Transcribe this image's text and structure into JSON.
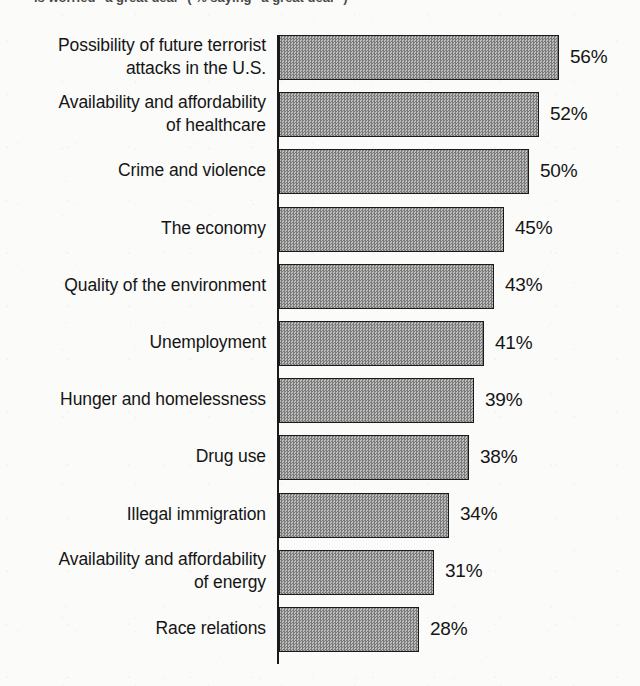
{
  "caption": {
    "clipped_text": "is worried \"a great deal\"  ( % saying \"a great deal\" )"
  },
  "chart_data": {
    "type": "bar",
    "orientation": "horizontal",
    "title": "",
    "subtitle": "",
    "xlabel": "",
    "ylabel": "",
    "xlim": [
      0,
      56
    ],
    "grid": false,
    "legend": "none",
    "value_suffix": "%",
    "categories": [
      "Possibility of future terrorist\nattacks in the U.S.",
      "Availability and affordability\nof healthcare",
      "Crime and violence",
      "The economy",
      "Quality of the environment",
      "Unemployment",
      "Hunger and homelessness",
      "Drug use",
      "Illegal immigration",
      "Availability and affordability\nof energy",
      "Race relations"
    ],
    "values": [
      56,
      52,
      50,
      45,
      43,
      41,
      39,
      38,
      34,
      31,
      28
    ],
    "value_labels": [
      "56%",
      "52%",
      "50%",
      "45%",
      "43%",
      "41%",
      "39%",
      "38%",
      "34%",
      "31%",
      "28%"
    ],
    "colors": {
      "bar_fill": "#9a9a9a",
      "bar_border": "#1a1a1a",
      "axis": "#1a1a1a",
      "background": "#fbfbfa",
      "text": "#151515"
    }
  },
  "geometry": {
    "axis_x": 278,
    "bar_start_x": 279,
    "px_per_unit": 5.0,
    "first_bar_top": 35,
    "bar_height": 45,
    "row_pitch": 57.2
  }
}
